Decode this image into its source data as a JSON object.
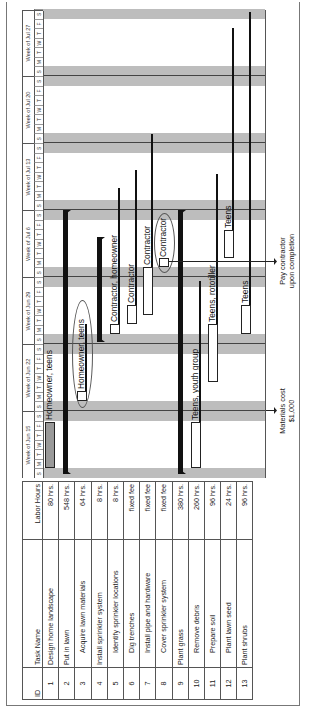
{
  "table": {
    "headers": {
      "id": "ID",
      "name": "Task Name",
      "hours": "Labor Hours"
    },
    "rows": [
      {
        "id": "1",
        "name": "Design home landscape",
        "hours": "80 hrs.",
        "indent": false
      },
      {
        "id": "2",
        "name": "Put in lawn",
        "hours": "548 hrs.",
        "indent": false
      },
      {
        "id": "3",
        "name": "Acquire lawn materials",
        "hours": "64 hrs.",
        "indent": true
      },
      {
        "id": "4",
        "name": "Install sprinkler system",
        "hours": "8 hrs.",
        "indent": true
      },
      {
        "id": "5",
        "name": "Identify sprinkler locations",
        "hours": "8 hrs.",
        "indent": true
      },
      {
        "id": "6",
        "name": "Dig trenches",
        "hours": "fixed fee",
        "indent": true
      },
      {
        "id": "7",
        "name": "Install pipe and hardware",
        "hours": "fixed fee",
        "indent": true
      },
      {
        "id": "8",
        "name": "Cover sprinkler system",
        "hours": "fixed fee",
        "indent": true
      },
      {
        "id": "9",
        "name": "Plant grass",
        "hours": "380 hrs.",
        "indent": false
      },
      {
        "id": "10",
        "name": "Remove debris",
        "hours": "260 hrs.",
        "indent": true
      },
      {
        "id": "11",
        "name": "Prepare soil",
        "hours": "96 hrs.",
        "indent": true
      },
      {
        "id": "12",
        "name": "Plant lawn seed",
        "hours": "24 hrs.",
        "indent": true
      },
      {
        "id": "13",
        "name": "Plant shrubs",
        "hours": "96 hrs.",
        "indent": false
      }
    ]
  },
  "timeline": {
    "weeks": [
      "Week of Jun 15",
      "Week of Jun 22",
      "Week of Jun 29",
      "Week of Jul 6",
      "Week of Jul 13",
      "Week of Jul 20",
      "Week of Jul 27"
    ],
    "days": [
      "S",
      "M",
      "T",
      "W",
      "T",
      "F",
      "S"
    ]
  },
  "bar_labels": {
    "r1": "Homeowner, teens",
    "r3": "Homeowner, teens",
    "r5": "Contractor, homeowner",
    "r6": "Contractor",
    "r7": "Contractor",
    "r8": "Contractor",
    "r10": "Teens, youth group",
    "r11": "Teens, rototiller",
    "r12": "Teens",
    "r13": "Teens"
  },
  "annotations": {
    "materials": {
      "line1": "Materials cost",
      "line2": "$1,000"
    },
    "contractor": {
      "line1": "Pay contractor",
      "line2": "upon completion"
    }
  },
  "chart_data": {
    "type": "gantt",
    "title": "",
    "columns": [
      "ID",
      "Task Name",
      "Labor Hours"
    ],
    "time_axis": {
      "weeks": [
        "Week of Jun 15",
        "Week of Jun 22",
        "Week of Jun 29",
        "Week of Jul 6",
        "Week of Jul 13",
        "Week of Jul 20",
        "Week of Jul 27"
      ],
      "day_labels": [
        "S",
        "M",
        "T",
        "W",
        "T",
        "F",
        "S"
      ],
      "weekends_shaded": true
    },
    "tasks": [
      {
        "id": 1,
        "name": "Design home landscape",
        "labor": "80 hrs.",
        "start": "Jun 15 (M)",
        "end": "Jun 19 (F)",
        "resources": "Homeowner, teens",
        "kind": "task"
      },
      {
        "id": 2,
        "name": "Put in lawn",
        "labor": "548 hrs.",
        "start": "Jun 15",
        "end": "Jul 10",
        "kind": "summary"
      },
      {
        "id": 3,
        "name": "Acquire lawn materials",
        "labor": "64 hrs.",
        "start": "Jun 22",
        "end": "Jun 23",
        "resources": "Homeowner, teens",
        "kind": "task"
      },
      {
        "id": 4,
        "name": "Install sprinkler system",
        "labor": "8 hrs.",
        "start": "Jun 29",
        "end": "Jul 8",
        "kind": "summary"
      },
      {
        "id": 5,
        "name": "Identify sprinkler locations",
        "labor": "8 hrs.",
        "start": "Jun 29",
        "end": "Jun 29",
        "resources": "Contractor, homeowner",
        "kind": "task"
      },
      {
        "id": 6,
        "name": "Dig trenches",
        "labor": "fixed fee",
        "start": "Jun 30",
        "end": "Jul 1",
        "resources": "Contractor",
        "kind": "task"
      },
      {
        "id": 7,
        "name": "Install pipe and hardware",
        "labor": "fixed fee",
        "start": "Jul 1",
        "end": "Jul 6",
        "resources": "Contractor",
        "kind": "task"
      },
      {
        "id": 8,
        "name": "Cover sprinkler system",
        "labor": "fixed fee",
        "start": "Jul 7",
        "end": "Jul 7",
        "resources": "Contractor",
        "kind": "task"
      },
      {
        "id": 9,
        "name": "Plant grass",
        "labor": "380 hrs.",
        "start": "Jun 15",
        "end": "Jul 10",
        "kind": "summary"
      },
      {
        "id": 10,
        "name": "Remove debris",
        "labor": "260 hrs.",
        "start": "Jun 15",
        "end": "Jun 19",
        "resources": "Teens, youth group",
        "kind": "task"
      },
      {
        "id": 11,
        "name": "Prepare soil",
        "labor": "96 hrs.",
        "start": "Jun 24",
        "end": "Jun 30",
        "resources": "Teens, rototiller",
        "kind": "task"
      },
      {
        "id": 12,
        "name": "Plant lawn seed",
        "labor": "24 hrs.",
        "start": "Jul 8",
        "end": "Jul 10",
        "resources": "Teens",
        "kind": "task"
      },
      {
        "id": 13,
        "name": "Plant shrubs",
        "labor": "96 hrs.",
        "start": "Jun 29",
        "end": "Jul 1",
        "resources": "Teens",
        "kind": "task"
      }
    ],
    "annotations": [
      "Materials cost $1,000",
      "Pay contractor upon completion"
    ],
    "orientation": "rotated 90° counter-clockwise"
  }
}
